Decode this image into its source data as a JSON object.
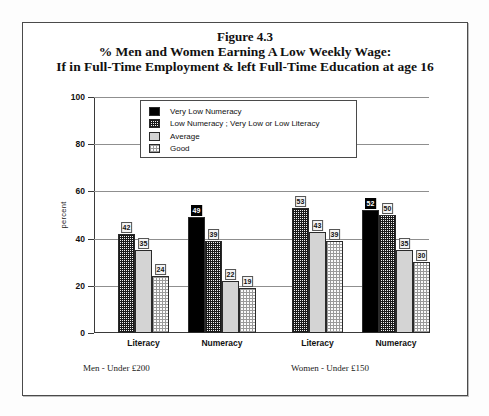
{
  "figure": {
    "title_line1": "Figure 4.3",
    "title_line2": "% Men and Women Earning A Low Weekly Wage:",
    "title_line3": "If in Full-Time Employment & left Full-Time Education at age 16"
  },
  "legend": {
    "items": [
      {
        "label": "Very Low Numeracy",
        "pattern": "solid-black",
        "color": "#000000"
      },
      {
        "label": "Low Numeracy ; Very Low or Low Literacy",
        "pattern": "dense-checker",
        "color": "#1a1a1a"
      },
      {
        "label": "Average",
        "pattern": "solid-light-gray",
        "color": "#d4d4d4"
      },
      {
        "label": "Good",
        "pattern": "sparse-checker",
        "color": "#9a9a9a"
      }
    ]
  },
  "footers": {
    "men": "Men - Under £200",
    "women": "Women - Under £150"
  },
  "axis": {
    "ylabel": "percent",
    "yticks": [
      "0",
      "20",
      "40",
      "60",
      "80",
      "100"
    ]
  },
  "groups": [
    {
      "label": "Literacy"
    },
    {
      "label": "Numeracy"
    },
    {
      "label": "Literacy"
    },
    {
      "label": "Numeracy"
    }
  ],
  "chart_data": {
    "type": "bar",
    "title": "% Men and Women Earning A Low Weekly Wage: If in Full-Time Employment & left Full-Time Education at age 16",
    "xlabel": "",
    "ylabel": "percent",
    "ylim": [
      0,
      100
    ],
    "yticks": [
      0,
      20,
      40,
      60,
      80,
      100
    ],
    "grid": true,
    "legend_position": "top-left-inside",
    "panels": [
      {
        "name": "Men - Under £200",
        "categories": [
          "Literacy",
          "Numeracy"
        ]
      },
      {
        "name": "Women - Under £150",
        "categories": [
          "Literacy",
          "Numeracy"
        ]
      }
    ],
    "series": [
      {
        "name": "Very Low Numeracy",
        "values": [
          null,
          49,
          null,
          52
        ]
      },
      {
        "name": "Low Numeracy ; Very Low or Low Literacy",
        "values": [
          42,
          39,
          53,
          50
        ]
      },
      {
        "name": "Average",
        "values": [
          35,
          22,
          43,
          35
        ]
      },
      {
        "name": "Good",
        "values": [
          24,
          19,
          39,
          30
        ]
      }
    ],
    "group_labels": [
      "Men-Literacy",
      "Men-Numeracy",
      "Women-Literacy",
      "Women-Numeracy"
    ],
    "bars": [
      {
        "group": "Men-Literacy",
        "series": "Low Numeracy ; Very Low or Low Literacy",
        "value": 42
      },
      {
        "group": "Men-Literacy",
        "series": "Average",
        "value": 35
      },
      {
        "group": "Men-Literacy",
        "series": "Good",
        "value": 24
      },
      {
        "group": "Men-Numeracy",
        "series": "Very Low Numeracy",
        "value": 49
      },
      {
        "group": "Men-Numeracy",
        "series": "Low Numeracy ; Very Low or Low Literacy",
        "value": 39
      },
      {
        "group": "Men-Numeracy",
        "series": "Average",
        "value": 22
      },
      {
        "group": "Men-Numeracy",
        "series": "Good",
        "value": 19
      },
      {
        "group": "Women-Literacy",
        "series": "Low Numeracy ; Very Low or Low Literacy",
        "value": 53
      },
      {
        "group": "Women-Literacy",
        "series": "Average",
        "value": 43
      },
      {
        "group": "Women-Literacy",
        "series": "Good",
        "value": 39
      },
      {
        "group": "Women-Numeracy",
        "series": "Very Low Numeracy",
        "value": 52
      },
      {
        "group": "Women-Numeracy",
        "series": "Low Numeracy ; Very Low or Low Literacy",
        "value": 50
      },
      {
        "group": "Women-Numeracy",
        "series": "Average",
        "value": 35
      },
      {
        "group": "Women-Numeracy",
        "series": "Good",
        "value": 30
      }
    ]
  }
}
